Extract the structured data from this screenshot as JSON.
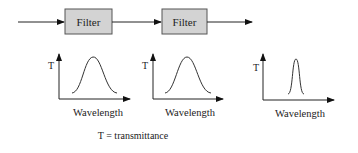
{
  "pipeline": {
    "filters": [
      {
        "label": "Filter"
      },
      {
        "label": "Filter"
      }
    ]
  },
  "plots": [
    {
      "y_label": "T",
      "x_label": "Wavelength",
      "peak": "broad"
    },
    {
      "y_label": "T",
      "x_label": "Wavelength",
      "peak": "broad"
    },
    {
      "y_label": "T",
      "x_label": "Wavelength",
      "peak": "narrow"
    }
  ],
  "caption": "T = transmittance",
  "colors": {
    "filter_fill": "#d3d3d3",
    "filter_stroke": "#555555",
    "line": "#222222"
  }
}
